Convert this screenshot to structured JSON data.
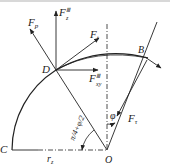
{
  "diagram": {
    "points": {
      "O": "O",
      "C": "C",
      "D": "D",
      "B": "B"
    },
    "forces": {
      "Fp": {
        "base": "F",
        "sub": "p"
      },
      "FzIII": {
        "base": "F",
        "sub": "z",
        "sup": "Ⅲ"
      },
      "FtD": {
        "base": "F",
        "sub": "t"
      },
      "FxyIII": {
        "base": "F",
        "sub": "xy",
        "sup": "Ⅲ"
      },
      "FtB": {
        "base": "F",
        "sub": "τ"
      }
    },
    "radius_label": {
      "base": "r",
      "sub": "z"
    },
    "angle_phi": "φ",
    "angle_expr": "π/4+φ/2",
    "colors": {
      "stroke": "#222222",
      "background": "#ffffff"
    }
  }
}
